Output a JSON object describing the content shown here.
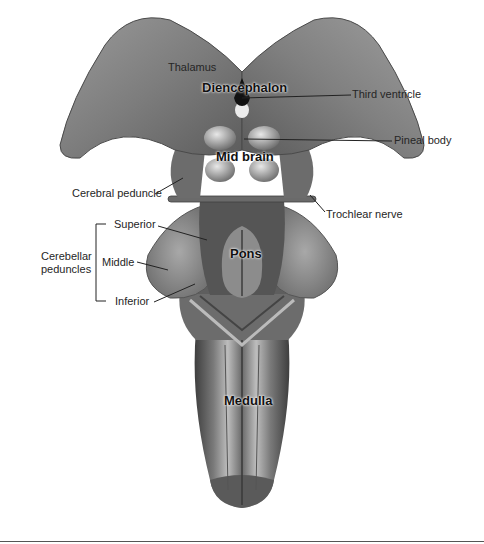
{
  "figure": {
    "type": "anatomical illustration",
    "region_labels": {
      "diencephalon": "Diencephalon",
      "midbrain": "Mid brain",
      "pons": "Pons",
      "medulla": "Medulla"
    },
    "structure_labels": {
      "thalamus": "Thalamus",
      "third_ventricle": "Third ventricle",
      "pineal_body": "Pineal body",
      "cerebral_peduncle": "Cerebral peduncle",
      "trochlear_nerve": "Trochlear nerve",
      "cerebellar_peduncles": {
        "group_label_line1": "Cerebellar",
        "group_label_line2": "peduncles",
        "superior": "Superior",
        "middle": "Middle",
        "inferior": "Inferior"
      }
    },
    "colors": {
      "tissue_dark": "#4a4a4a",
      "tissue_mid": "#8a8a8a",
      "tissue_light": "#cfcfcf",
      "leader_line": "#222222",
      "background": "#ffffff"
    }
  }
}
